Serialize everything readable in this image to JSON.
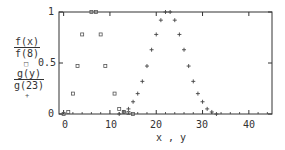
{
  "chart_data": {
    "type": "scatter",
    "title": "",
    "xlabel": "x , y",
    "ylabel_series": [
      {
        "numerator": "f(x)",
        "denominator": "f(8)",
        "marker": "□"
      },
      {
        "numerator": "g(y)",
        "denominator": "g(23)",
        "marker": "+"
      }
    ],
    "xlim": [
      -1,
      45
    ],
    "ylim": [
      0,
      1
    ],
    "x_ticks": [
      0,
      10,
      20,
      30,
      40
    ],
    "y_ticks": [
      0,
      0.5,
      1
    ],
    "y_tick_labels": [
      "0",
      "0.5",
      "1"
    ],
    "grid": false,
    "legend_position": "left, stacked in y-axis label",
    "series": [
      {
        "name": "f(x)/f(8)",
        "marker": "square",
        "points": [
          [
            0,
            0.0
          ],
          [
            1,
            0.02
          ],
          [
            2,
            0.2
          ],
          [
            3,
            0.47
          ],
          [
            4,
            0.78
          ],
          [
            6,
            1.0
          ],
          [
            7,
            1.0
          ],
          [
            8,
            0.78
          ],
          [
            9,
            0.47
          ],
          [
            11,
            0.2
          ],
          [
            12,
            0.05
          ],
          [
            13,
            0.02
          ],
          [
            14,
            0.01
          ],
          [
            15,
            0.0
          ]
        ]
      },
      {
        "name": "g(y)/g(23)",
        "marker": "plus",
        "points": [
          [
            12,
            0.0
          ],
          [
            13,
            0.02
          ],
          [
            14,
            0.05
          ],
          [
            15,
            0.12
          ],
          [
            16,
            0.2
          ],
          [
            17,
            0.32
          ],
          [
            18,
            0.47
          ],
          [
            19,
            0.63
          ],
          [
            20,
            0.78
          ],
          [
            21,
            0.92
          ],
          [
            22,
            1.0
          ],
          [
            23,
            1.0
          ],
          [
            24,
            0.92
          ],
          [
            25,
            0.78
          ],
          [
            26,
            0.63
          ],
          [
            27,
            0.47
          ],
          [
            28,
            0.32
          ],
          [
            29,
            0.2
          ],
          [
            30,
            0.12
          ],
          [
            31,
            0.05
          ],
          [
            32,
            0.02
          ],
          [
            33,
            0.0
          ]
        ]
      }
    ]
  },
  "labels": {
    "y_tick_0": "0",
    "y_tick_05": "0.5",
    "y_tick_1": "1",
    "x_tick_0": "0",
    "x_tick_10": "10",
    "x_tick_20": "20",
    "x_tick_30": "30",
    "x_tick_40": "40",
    "xlabel": "x , y",
    "f_num": "f(x)",
    "f_den": "f(8)",
    "f_marker": "□",
    "g_num": "g(y)",
    "g_den": "g(23)",
    "g_marker": "+"
  }
}
